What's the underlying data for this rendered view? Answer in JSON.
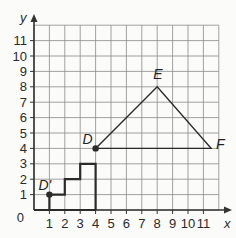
{
  "diagram": {
    "type": "coordinate-grid",
    "x_axis": {
      "label": "x",
      "ticks": [
        "1",
        "2",
        "3",
        "4",
        "5",
        "6",
        "7",
        "8",
        "9",
        "10",
        "11"
      ],
      "origin_label": "0",
      "min": 0,
      "max": 12
    },
    "y_axis": {
      "label": "y",
      "ticks": [
        "1",
        "2",
        "3",
        "4",
        "5",
        "6",
        "7",
        "8",
        "9",
        "10",
        "11"
      ],
      "min": 0,
      "max": 12
    },
    "points": [
      {
        "name": "D'",
        "x": 1,
        "y": 1,
        "dot": true
      },
      {
        "name": "D",
        "x": 4,
        "y": 4,
        "dot": true
      },
      {
        "name": "E",
        "x": 8,
        "y": 8,
        "dot": false
      },
      {
        "name": "F",
        "x": 11.5,
        "y": 4,
        "dot": false
      }
    ],
    "staircase": [
      [
        1,
        0
      ],
      [
        1,
        1
      ],
      [
        2,
        1
      ],
      [
        2,
        2
      ],
      [
        3,
        2
      ],
      [
        3,
        3
      ],
      [
        4,
        3
      ],
      [
        4,
        0
      ]
    ],
    "triangle": [
      [
        4,
        4
      ],
      [
        8,
        8
      ],
      [
        11.5,
        4
      ]
    ],
    "colors": {
      "grid": "#8a8a8a",
      "axis": "#333333",
      "shape": "#2b2b2b",
      "background": "#fbfbfa"
    }
  }
}
